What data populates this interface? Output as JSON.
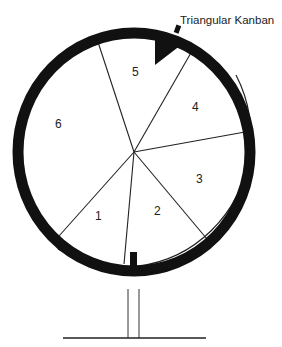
{
  "diagram": {
    "title_label": "Triangular Kanban",
    "segments": [
      {
        "label": "1"
      },
      {
        "label": "2"
      },
      {
        "label": "3"
      },
      {
        "label": "4"
      },
      {
        "label": "5"
      },
      {
        "label": "6"
      }
    ],
    "colors": {
      "ring": "#111111",
      "line": "#222222",
      "background": "#ffffff"
    }
  }
}
